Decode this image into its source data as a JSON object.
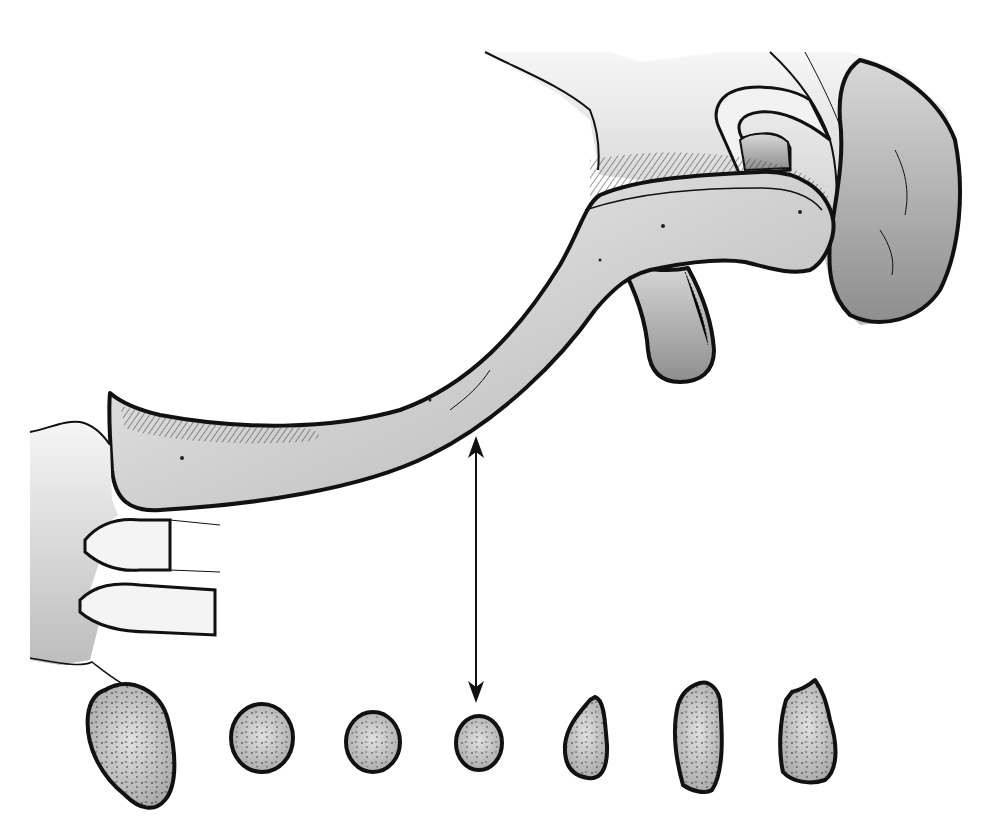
{
  "figure": {
    "title": "",
    "colors": {
      "background": "#ffffff",
      "outline": "#111111",
      "bone_light": "#e6e6e6",
      "bone_mid": "#bdbdbd",
      "bone_dark": "#9a9a9a"
    },
    "arrow": {
      "type": "double-headed",
      "orientation": "vertical"
    },
    "cross_sections": {
      "count": 7
    }
  }
}
